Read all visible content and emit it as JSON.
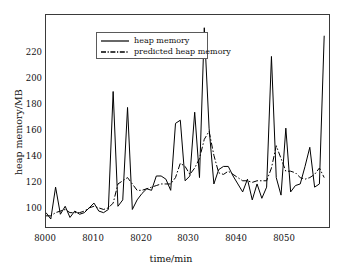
{
  "chart_data": {
    "type": "line",
    "title": "",
    "xlabel": "time/min",
    "ylabel": "heap memory/MB",
    "xlim": [
      8000,
      8059
    ],
    "ylim": [
      95,
      228
    ],
    "xticks": [
      8000,
      8010,
      8020,
      8030,
      8040,
      8050
    ],
    "yticks": [
      100,
      120,
      140,
      160,
      180,
      200,
      220
    ],
    "grid": false,
    "legend_position": "upper-left",
    "x": [
      8000,
      8001,
      8002,
      8003,
      8004,
      8005,
      8006,
      8007,
      8008,
      8009,
      8010,
      8011,
      8012,
      8013,
      8014,
      8015,
      8016,
      8017,
      8018,
      8019,
      8020,
      8021,
      8022,
      8023,
      8024,
      8025,
      8026,
      8027,
      8028,
      8029,
      8030,
      8031,
      8032,
      8033,
      8034,
      8035,
      8036,
      8037,
      8038,
      8039,
      8040,
      8041,
      8042,
      8043,
      8044,
      8045,
      8046,
      8047,
      8048,
      8049,
      8050,
      8051,
      8052,
      8053,
      8054,
      8055,
      8056,
      8057,
      8058
    ],
    "series": [
      {
        "name": "heap memory",
        "style": "solid",
        "color": "#000000",
        "values": [
          104,
          100,
          120,
          103,
          108,
          101,
          105,
          103,
          104,
          107,
          110,
          105,
          104,
          106,
          180,
          108,
          112,
          170,
          106,
          112,
          116,
          119,
          118,
          127,
          127,
          125,
          118,
          160,
          162,
          124,
          127,
          167,
          126,
          220,
          157,
          122,
          131,
          133,
          133,
          127,
          122,
          117,
          125,
          112,
          122,
          113,
          120,
          202,
          126,
          115,
          157,
          117,
          121,
          122,
          133,
          145,
          120,
          122,
          215
        ]
      },
      {
        "name": "predicted heap memory",
        "style": "dashdot",
        "color": "#000000",
        "values": [
          102,
          102,
          104,
          105,
          106,
          104,
          104,
          104,
          105,
          107,
          108,
          107,
          106,
          107,
          110,
          122,
          124,
          126,
          122,
          118,
          118,
          119,
          120,
          121,
          122,
          122,
          122,
          126,
          135,
          133,
          128,
          132,
          138,
          150,
          155,
          140,
          129,
          128,
          130,
          128,
          126,
          124,
          124,
          123,
          124,
          124,
          124,
          132,
          146,
          138,
          130,
          130,
          129,
          126,
          125,
          126,
          128,
          132,
          126
        ]
      }
    ]
  },
  "legend": {
    "entries": [
      {
        "label": "heap memory",
        "style": "solid"
      },
      {
        "label": "predicted heap memory",
        "style": "dashdot"
      }
    ]
  },
  "axes": {
    "x_title": "time/min",
    "y_title": "heap memory/MB",
    "x_tick_labels": [
      "8000",
      "8010",
      "8020",
      "8030",
      "8040",
      "8050"
    ],
    "y_tick_labels": [
      "100",
      "120",
      "140",
      "160",
      "180",
      "200",
      "220"
    ]
  }
}
